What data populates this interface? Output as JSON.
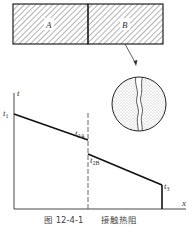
{
  "figure": {
    "caption_number": "图 12-4-1",
    "caption_title": "接触热阻",
    "blocks": [
      {
        "label": "A"
      },
      {
        "label": "B"
      }
    ],
    "axes": {
      "y_label": "t",
      "x_label": "x"
    },
    "points": {
      "t1": {
        "main": "t",
        "sub": "1"
      },
      "t2A": {
        "main": "t",
        "sub": "2A"
      },
      "t2B": {
        "main": "t",
        "sub": "2B"
      },
      "t3": {
        "main": "t",
        "sub": "3"
      }
    },
    "inset": "magnified-contact-interface"
  }
}
